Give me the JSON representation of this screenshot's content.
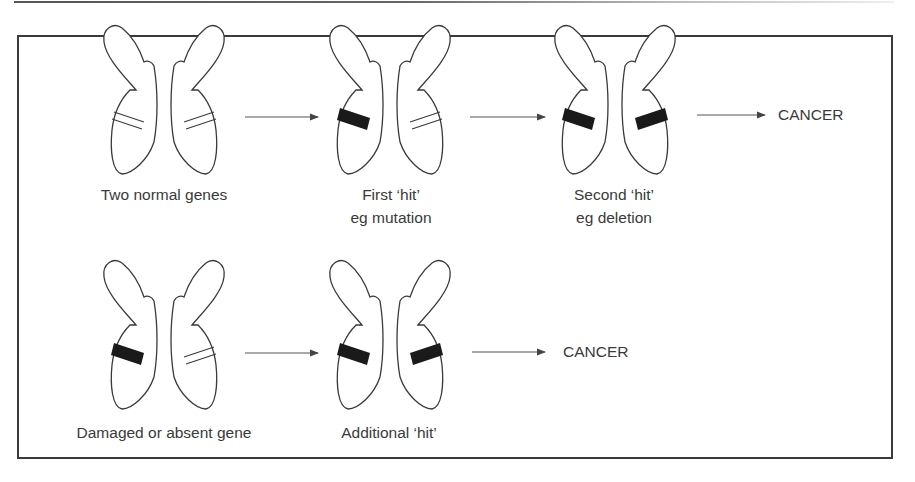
{
  "diagram": {
    "rows": [
      {
        "name": "sporadic",
        "stages": [
          {
            "caption_line1": "Two normal genes",
            "caption_line2": "",
            "left_band": "normal",
            "right_band": "normal"
          },
          {
            "caption_line1": "First ‘hit’",
            "caption_line2": "eg mutation",
            "left_band": "damaged",
            "right_band": "normal"
          },
          {
            "caption_line1": "Second ‘hit’",
            "caption_line2": "eg deletion",
            "left_band": "damaged",
            "right_band": "damaged"
          }
        ],
        "outcome": "CANCER"
      },
      {
        "name": "inherited",
        "stages": [
          {
            "caption_line1": "Damaged or absent gene",
            "caption_line2": "",
            "left_band": "damaged",
            "right_band": "normal"
          },
          {
            "caption_line1": "Additional ‘hit’",
            "caption_line2": "",
            "left_band": "damaged",
            "right_band": "damaged"
          }
        ],
        "outcome": "CANCER"
      }
    ],
    "colors": {
      "stroke": "#3a3a3a",
      "band_damaged": "#1a1a1a",
      "arrow": "#555555"
    }
  }
}
